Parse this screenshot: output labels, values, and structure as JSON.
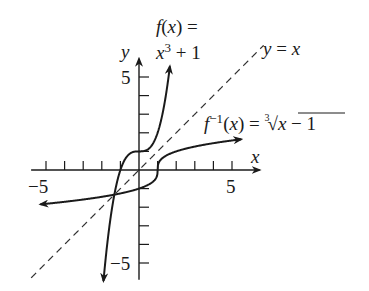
{
  "chart_data": {
    "type": "line",
    "title": "",
    "xlabel": "x",
    "ylabel": "y",
    "xlim": [
      -5.8,
      6.7
    ],
    "ylim": [
      -5.9,
      6.2
    ],
    "grid": false,
    "x_ticks": [
      -5,
      -4,
      -3,
      -2,
      -1,
      1,
      2,
      3,
      4,
      5
    ],
    "y_ticks": [
      -5,
      -4,
      -3,
      -2,
      -1,
      1,
      2,
      3,
      4,
      5
    ],
    "x_tick_labels": [
      {
        "value": -5,
        "text": "−5"
      },
      {
        "value": 5,
        "text": "5"
      }
    ],
    "y_tick_labels": [
      {
        "value": 5,
        "text": "5"
      },
      {
        "value": -5,
        "text": "−5"
      }
    ],
    "series": [
      {
        "name": "f(x) = x^3 + 1",
        "expression": "x^3 + 1",
        "domain": [
          -1.91,
          1.66
        ],
        "style": "solid",
        "arrows": "both",
        "label_lines": [
          "f(x) =",
          "x³ + 1"
        ]
      },
      {
        "name": "f^-1(x) = cbrt(x - 1)",
        "expression": "cbrt(x - 1)",
        "domain": [
          -5.3,
          5.5
        ],
        "style": "solid",
        "arrows": "both",
        "label": "f⁻¹(x) = ∛(x − 1)"
      },
      {
        "name": "y = x",
        "expression": "x",
        "domain": [
          -5.8,
          6.7
        ],
        "style": "dashed",
        "arrows": "none",
        "label": "y = x"
      }
    ],
    "colors": {
      "curve": "#1a1a1a",
      "axis": "#1a1a1a",
      "dashed": "#333333"
    }
  }
}
